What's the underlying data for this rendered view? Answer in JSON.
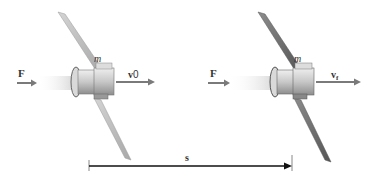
{
  "diagram": {
    "type": "work-energy illustration",
    "states": [
      {
        "id": "initial",
        "force_label": "F",
        "mass_label": "m",
        "velocity_label": "v",
        "velocity_subscript": "0",
        "panel_color": "#b8b8b8"
      },
      {
        "id": "final",
        "force_label": "F",
        "mass_label": "m",
        "velocity_label": "v",
        "velocity_subscript": "f",
        "panel_color": "#6e6e6e"
      }
    ],
    "displacement_label": "s",
    "colors": {
      "arrow": "#7a7a7a",
      "displacement_line": "#111111",
      "thrust_plume": "#e4e4e4",
      "body": "#c9c9c9"
    }
  }
}
